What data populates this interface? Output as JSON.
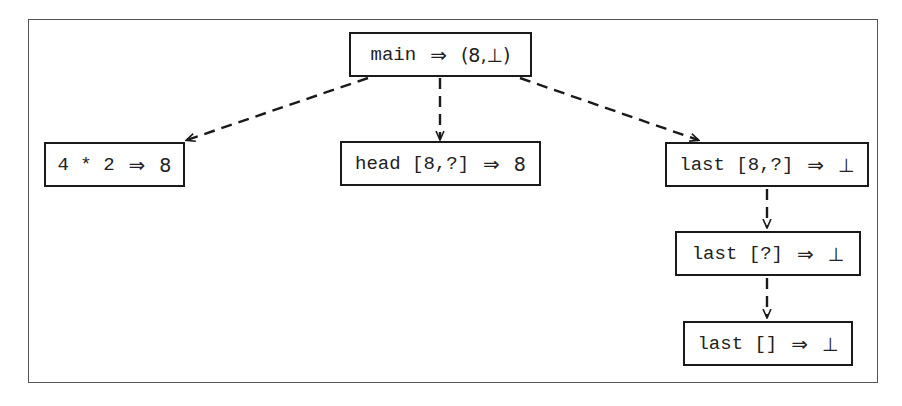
{
  "diagram": {
    "type": "evaluation-tree",
    "edge_style": "dashed-arrow",
    "nodes": [
      {
        "id": "main",
        "expr": "main",
        "arrow": "⇒",
        "result": "(8,⊥)"
      },
      {
        "id": "mul",
        "expr": "4 * 2",
        "arrow": "⇒",
        "result": "8"
      },
      {
        "id": "head",
        "expr": "head [8,?]",
        "arrow": "⇒",
        "result": "8"
      },
      {
        "id": "last1",
        "expr": "last [8,?]",
        "arrow": "⇒",
        "result": "⊥"
      },
      {
        "id": "last2",
        "expr": "last [?]",
        "arrow": "⇒",
        "result": "⊥"
      },
      {
        "id": "last3",
        "expr": "last []",
        "arrow": "⇒",
        "result": "⊥"
      }
    ],
    "edges": [
      {
        "from": "main",
        "to": "mul"
      },
      {
        "from": "main",
        "to": "head"
      },
      {
        "from": "main",
        "to": "last1"
      },
      {
        "from": "last1",
        "to": "last2"
      },
      {
        "from": "last2",
        "to": "last3"
      }
    ]
  }
}
